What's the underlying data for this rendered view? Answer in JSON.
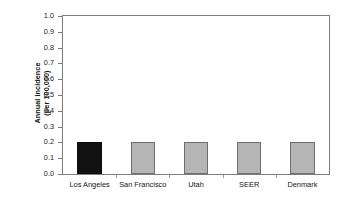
{
  "chart_data": {
    "type": "bar",
    "title": "",
    "subtitle": "",
    "xlabel": "",
    "ylabel": "Annual incidence\n(per 100,000)",
    "ylabel_line1": "Annual incidence",
    "ylabel_line2": "(per 100,000)",
    "categories": [
      "Los Angeles",
      "San Francisco",
      "Utah",
      "SEER",
      "Denmark"
    ],
    "values": [
      0.2,
      0.2,
      0.2,
      0.2,
      0.2
    ],
    "ylim": [
      0.0,
      1.0
    ],
    "ytick_labels": [
      "1.0",
      "0.9",
      "0.8",
      "0.7",
      "0.6",
      "0.5",
      "0.4",
      "0.3",
      "0.2",
      "0.1",
      "0.0"
    ],
    "ytick_values": [
      1.0,
      0.9,
      0.8,
      0.7,
      0.6,
      0.5,
      0.4,
      0.3,
      0.2,
      0.1,
      0.0
    ],
    "grid": false,
    "legend": "none",
    "bar_colors": [
      "#111111",
      "#b5b5b5",
      "#b5b5b5",
      "#b5b5b5",
      "#b5b5b5"
    ],
    "bar_border_color": "#6e6e6e",
    "highlight_category": "Los Angeles",
    "frame_color": "#7d7d7d",
    "background": "#ffffff"
  }
}
